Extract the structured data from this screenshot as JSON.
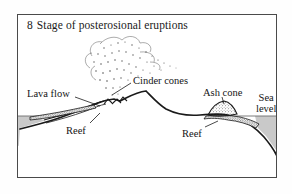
{
  "figure": {
    "title": {
      "number": "8",
      "text": "Stage of posterosional eruptions"
    },
    "border_color": "#4a4a4a",
    "background": "#ffffff"
  },
  "diagram": {
    "type": "cross-section",
    "sea_level_y": 116,
    "water_color": "#c9c9c9",
    "ink_color": "#1a1a1a"
  },
  "labels": {
    "lava_flow": "Lava flow",
    "cinder_cones": "Cinder cones",
    "ash_cone": "Ash cone",
    "sea_level_line1": "Sea",
    "sea_level_line2": "level",
    "reef_left": "Reef",
    "reef_right": "Reef"
  },
  "features": {
    "ash_plume": "stippled eruption cloud",
    "main_peak": "eroded volcanic island",
    "reef_band": "fringing reef at sea level"
  }
}
